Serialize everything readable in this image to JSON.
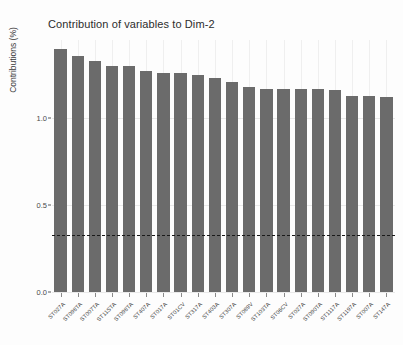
{
  "chart_data": {
    "type": "bar",
    "title": "Contribution of variables to Dim-2",
    "xlabel": "",
    "ylabel": "Contributions (%)",
    "ylim": [
      0.0,
      1.45
    ],
    "yticks": [
      0.0,
      0.5,
      1.0
    ],
    "ytick_labels": [
      "0.0",
      "0.5",
      "1.0"
    ],
    "grid": true,
    "legend": "none",
    "bar_color": "#6b6b6b",
    "reference_line": {
      "value": 0.33,
      "style": "dashed",
      "color": "#1a1a1a",
      "label": "expected average contribution"
    },
    "categories": [
      "ST027A",
      "ST098TA",
      "ST007TA",
      "ST11STA",
      "ST098TA",
      "ST407A",
      "ST017A",
      "ST01CV",
      "ST317A",
      "ST403A",
      "ST307A",
      "ST089V",
      "ST103TA",
      "ST06CV",
      "ST027A",
      "ST090TA",
      "ST1117A",
      "ST1197A",
      "ST007A",
      "ST147A"
    ],
    "values": [
      1.4,
      1.36,
      1.33,
      1.3,
      1.3,
      1.27,
      1.26,
      1.26,
      1.25,
      1.23,
      1.21,
      1.18,
      1.17,
      1.17,
      1.17,
      1.17,
      1.16,
      1.13,
      1.13,
      1.12
    ]
  }
}
